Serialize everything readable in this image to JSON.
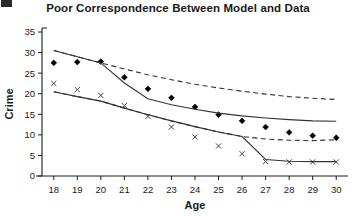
{
  "figure": {
    "corner_mark": "",
    "title": "Poor Correspondence Between Model and Data",
    "background_color": "#ffffff",
    "ink_color": "#1a1a1a"
  },
  "chart_data": {
    "type": "line",
    "title": "Poor Correspondence Between Model and Data",
    "xlabel": "Age",
    "ylabel": "Crime",
    "x": [
      18,
      19,
      20,
      21,
      22,
      23,
      24,
      25,
      26,
      27,
      28,
      29,
      30
    ],
    "xlim": [
      17.5,
      30.5
    ],
    "ylim": [
      0,
      35
    ],
    "xticks": [
      18,
      19,
      20,
      21,
      22,
      23,
      24,
      25,
      26,
      27,
      28,
      29,
      30
    ],
    "yticks": [
      0,
      5,
      10,
      15,
      20,
      25,
      30,
      35
    ],
    "grid": false,
    "legend": "none",
    "series": [
      {
        "name": "Data (upper, diamonds)",
        "marker": "diamond",
        "line": "none",
        "color": "#000000",
        "values": [
          27.5,
          27.7,
          27.8,
          24.0,
          21.2,
          19.0,
          16.8,
          14.9,
          13.4,
          11.9,
          10.6,
          9.8,
          9.3
        ]
      },
      {
        "name": "Data (lower, x-marks)",
        "marker": "x",
        "line": "none",
        "color": "#444444",
        "values": [
          22.5,
          21.0,
          19.6,
          17.1,
          14.5,
          11.9,
          9.5,
          7.3,
          5.4,
          3.5,
          3.4,
          3.4,
          3.4
        ]
      },
      {
        "name": "Model fit (upper solid)",
        "marker": "none",
        "line": "solid",
        "color": "#333333",
        "values": [
          30.5,
          29.0,
          27.5,
          22.6,
          18.8,
          17.3,
          16.2,
          15.3,
          14.6,
          14.1,
          13.7,
          13.4,
          13.3
        ]
      },
      {
        "name": "Model fit (lower solid)",
        "marker": "none",
        "line": "solid",
        "color": "#333333",
        "values": [
          20.5,
          19.3,
          18.2,
          16.5,
          14.9,
          13.4,
          12.0,
          10.7,
          9.6,
          4.0,
          3.6,
          3.5,
          3.5
        ]
      },
      {
        "name": "Confidence band (upper dashed)",
        "marker": "none",
        "line": "dashed",
        "color": "#333333",
        "values": [
          30.5,
          29.0,
          27.5,
          26.0,
          24.6,
          23.4,
          22.3,
          21.4,
          20.6,
          19.9,
          19.3,
          18.9,
          18.6
        ]
      },
      {
        "name": "Confidence band (lower dashed)",
        "marker": "none",
        "line": "dashed",
        "color": "#333333",
        "values": [
          20.5,
          19.3,
          18.2,
          16.5,
          14.9,
          13.4,
          12.0,
          10.7,
          9.6,
          9.0,
          8.7,
          8.6,
          8.8
        ]
      }
    ]
  }
}
